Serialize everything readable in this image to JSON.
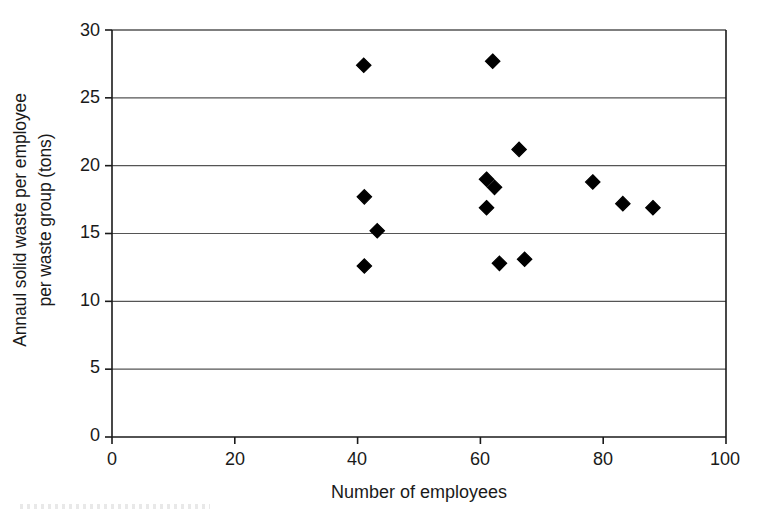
{
  "chart_data": {
    "type": "scatter",
    "title": "",
    "xlabel": "Number of employees",
    "ylabel": "Annaul solid waste per employee per waste group (tons)",
    "ylabel_line1": "Annaul solid waste per employee",
    "ylabel_line2": "per waste group (tons)",
    "xlim": [
      0,
      100
    ],
    "ylim": [
      0,
      30
    ],
    "xticks": [
      0,
      20,
      40,
      60,
      80,
      100
    ],
    "yticks": [
      0,
      5,
      10,
      15,
      20,
      25,
      30
    ],
    "xtick_labels": [
      "0",
      "20",
      "40",
      "60",
      "80",
      "100"
    ],
    "ytick_labels": [
      "0",
      "5",
      "10",
      "15",
      "20",
      "25",
      "30"
    ],
    "grid": "horizontal",
    "legend": "none",
    "marker": "filled-diamond",
    "marker_color": "#000000",
    "axis_color": "#1a1a1a",
    "grid_color": "#555555",
    "background": "#ffffff",
    "points": [
      {
        "x": 41.0,
        "y": 27.4
      },
      {
        "x": 62.0,
        "y": 27.7
      },
      {
        "x": 66.3,
        "y": 21.2
      },
      {
        "x": 61.0,
        "y": 19.0
      },
      {
        "x": 62.3,
        "y": 18.4
      },
      {
        "x": 78.3,
        "y": 18.8
      },
      {
        "x": 41.1,
        "y": 17.7
      },
      {
        "x": 83.2,
        "y": 17.2
      },
      {
        "x": 88.1,
        "y": 16.9
      },
      {
        "x": 61.0,
        "y": 16.9
      },
      {
        "x": 43.2,
        "y": 15.2
      },
      {
        "x": 41.1,
        "y": 12.6
      },
      {
        "x": 63.1,
        "y": 12.8
      },
      {
        "x": 67.2,
        "y": 13.1
      }
    ]
  }
}
